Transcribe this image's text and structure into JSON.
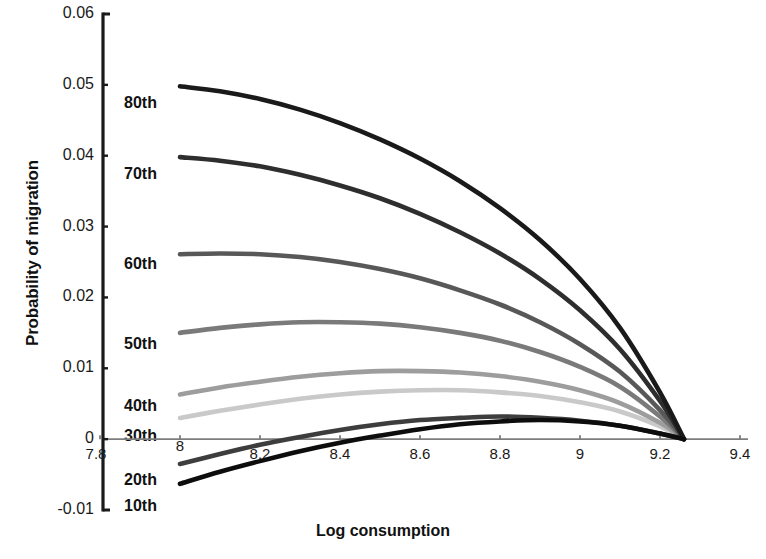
{
  "chart_data": {
    "type": "line",
    "title": "",
    "xlabel": "Log consumption",
    "ylabel": "Probability of migration",
    "xlim": [
      7.75,
      9.45
    ],
    "ylim": [
      -0.01,
      0.06
    ],
    "xticks": [
      7.8,
      8,
      8.2,
      8.4,
      8.6,
      8.8,
      9,
      9.2,
      9.4
    ],
    "xtick_labels": [
      "7.8",
      "8",
      "8.2",
      "8.4",
      "8.6",
      "8.8",
      "9",
      "9.2",
      "9.4"
    ],
    "yticks": [
      -0.01,
      0,
      0.01,
      0.02,
      0.03,
      0.04,
      0.05,
      0.06
    ],
    "ytick_labels": [
      "-0.01",
      "0",
      "0.01",
      "0.02",
      "0.03",
      "0.04",
      "0.05",
      "0.06"
    ],
    "grid": false,
    "legend_position": "inline-left",
    "convergence_x": 9.26,
    "convergence_y": 0,
    "x": [
      8.0,
      8.1,
      8.2,
      8.3,
      8.4,
      8.5,
      8.6,
      8.7,
      8.8,
      8.9,
      9.0,
      9.1,
      9.2,
      9.26
    ],
    "series": [
      {
        "name": "80th",
        "label": "80th",
        "color": "#1a1a1a",
        "values": [
          0.0498,
          0.0491,
          0.048,
          0.0465,
          0.0446,
          0.0423,
          0.0396,
          0.0364,
          0.0326,
          0.0281,
          0.0226,
          0.0157,
          0.0066,
          0.0
        ]
      },
      {
        "name": "70th",
        "label": "70th",
        "color": "#2e2e2e",
        "values": [
          0.0398,
          0.0393,
          0.0385,
          0.0373,
          0.0358,
          0.034,
          0.0318,
          0.0292,
          0.0262,
          0.0226,
          0.0182,
          0.0127,
          0.0054,
          0.0
        ]
      },
      {
        "name": "60th",
        "label": "60th",
        "color": "#585858",
        "values": [
          0.0261,
          0.0262,
          0.0261,
          0.0257,
          0.025,
          0.024,
          0.0227,
          0.021,
          0.019,
          0.0165,
          0.0134,
          0.0095,
          0.0041,
          0.0
        ]
      },
      {
        "name": "50th",
        "label": "50th",
        "color": "#7a7a7a",
        "values": [
          0.015,
          0.0157,
          0.0162,
          0.0165,
          0.0165,
          0.0163,
          0.0158,
          0.015,
          0.0139,
          0.0123,
          0.0102,
          0.0074,
          0.0032,
          0.0
        ]
      },
      {
        "name": "40th",
        "label": "40th",
        "color": "#9d9d9d",
        "values": [
          0.0063,
          0.0073,
          0.0081,
          0.0088,
          0.0093,
          0.0096,
          0.0096,
          0.0094,
          0.0089,
          0.0081,
          0.0069,
          0.0051,
          0.0023,
          0.0
        ]
      },
      {
        "name": "30th",
        "label": "30th",
        "color": "#c9c9c9",
        "values": [
          0.003,
          0.004,
          0.0049,
          0.0057,
          0.0063,
          0.0067,
          0.0069,
          0.0069,
          0.0066,
          0.0061,
          0.0052,
          0.0039,
          0.0018,
          0.0
        ]
      },
      {
        "name": "20th",
        "label": "20th",
        "color": "#3d3d3d",
        "values": [
          -0.0035,
          -0.0021,
          -0.0008,
          0.0003,
          0.0013,
          0.0021,
          0.0027,
          0.003,
          0.0032,
          0.003,
          0.0026,
          0.0019,
          0.0008,
          0.0
        ]
      },
      {
        "name": "10th",
        "label": "10th",
        "color": "#0d0d0d",
        "values": [
          -0.0063,
          -0.0046,
          -0.0031,
          -0.0017,
          -0.0005,
          0.0005,
          0.0014,
          0.0021,
          0.0025,
          0.0027,
          0.0025,
          0.0019,
          0.0008,
          0.0
        ]
      }
    ],
    "series_label_positions": [
      {
        "name": "80th",
        "x_px": 124,
        "y_px": 104
      },
      {
        "name": "70th",
        "x_px": 124,
        "y_px": 175
      },
      {
        "name": "60th",
        "x_px": 124,
        "y_px": 265
      },
      {
        "name": "50th",
        "x_px": 124,
        "y_px": 345
      },
      {
        "name": "40th",
        "x_px": 124,
        "y_px": 407
      },
      {
        "name": "30th",
        "x_px": 124,
        "y_px": 437
      },
      {
        "name": "20th",
        "x_px": 124,
        "y_px": 481
      },
      {
        "name": "10th",
        "x_px": 124,
        "y_px": 507
      }
    ]
  },
  "figure": {
    "background": "#ffffff",
    "axis_color": "#1a1a1a",
    "zero_line_color": "#7d7d7d",
    "bottom_caption": ""
  }
}
